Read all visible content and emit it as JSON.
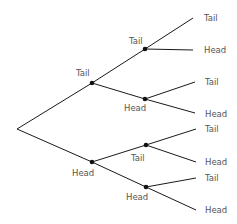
{
  "diagram": {
    "type": "probability-tree",
    "root": {
      "id": "root",
      "x": 17,
      "y": 129
    },
    "nodes": [
      {
        "id": "t",
        "label": "Tail",
        "x": 92,
        "y": 83,
        "parent": "root",
        "label_x": 76,
        "label_y": 76,
        "dot": true
      },
      {
        "id": "h",
        "label": "Head",
        "x": 92,
        "y": 162,
        "parent": "root",
        "label_x": 72,
        "label_y": 176,
        "dot": true
      },
      {
        "id": "tt",
        "label": "Tail",
        "x": 145,
        "y": 49,
        "parent": "t",
        "label_x": 129,
        "label_y": 44,
        "dot": true
      },
      {
        "id": "th",
        "label": "Head",
        "x": 145,
        "y": 99,
        "parent": "t",
        "label_x": 124,
        "label_y": 111,
        "dot": true
      },
      {
        "id": "ht",
        "label": "Tail",
        "x": 146,
        "y": 145,
        "parent": "h",
        "label_x": 131,
        "label_y": 161,
        "dot": true
      },
      {
        "id": "hh",
        "label": "Head",
        "x": 146,
        "y": 187,
        "parent": "h",
        "label_x": 126,
        "label_y": 200,
        "dot": true
      },
      {
        "id": "ttt",
        "label": "Tail",
        "x": 193,
        "y": 18,
        "parent": "tt",
        "label_x": 204,
        "label_y": 21,
        "dot": false
      },
      {
        "id": "tth",
        "label": "Head",
        "x": 193,
        "y": 50,
        "parent": "tt",
        "label_x": 204,
        "label_y": 53,
        "dot": false
      },
      {
        "id": "tht",
        "label": "Tail",
        "x": 195,
        "y": 82,
        "parent": "th",
        "label_x": 205,
        "label_y": 85,
        "dot": false
      },
      {
        "id": "thh",
        "label": "Head",
        "x": 195,
        "y": 113,
        "parent": "th",
        "label_x": 205,
        "label_y": 117,
        "dot": false
      },
      {
        "id": "htt",
        "label": "Tail",
        "x": 196,
        "y": 129,
        "parent": "ht",
        "label_x": 205,
        "label_y": 132,
        "dot": false
      },
      {
        "id": "hth",
        "label": "Head",
        "x": 196,
        "y": 162,
        "parent": "ht",
        "label_x": 205,
        "label_y": 165,
        "dot": false
      },
      {
        "id": "hht",
        "label": "Tail",
        "x": 196,
        "y": 178,
        "parent": "hh",
        "label_x": 205,
        "label_y": 181,
        "dot": false
      },
      {
        "id": "hhh",
        "label": "Head",
        "x": 196,
        "y": 210,
        "parent": "hh",
        "label_x": 205,
        "label_y": 213,
        "dot": false
      }
    ],
    "colors": {
      "edge": "#1a1a1a",
      "node": "#111111",
      "label": "#555555",
      "background": "#ffffff"
    }
  }
}
